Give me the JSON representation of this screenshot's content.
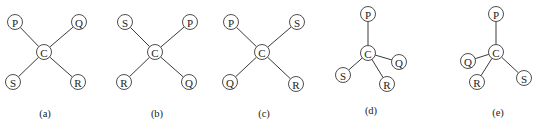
{
  "figure": {
    "node_radius": 7.5,
    "colors": {
      "line": "#3a3a3a",
      "text": "#222222",
      "fill": "#ffffff"
    },
    "panels": [
      {
        "id": "a",
        "caption": "(a)",
        "caption_pos": [
          45,
          117
        ],
        "center": {
          "label": "C",
          "x": 44,
          "y": 52
        },
        "nodes": [
          {
            "label": "P",
            "x": 15,
            "y": 22
          },
          {
            "label": "Q",
            "x": 79,
            "y": 22
          },
          {
            "label": "S",
            "x": 13,
            "y": 82
          },
          {
            "label": "R",
            "x": 78,
            "y": 82
          }
        ]
      },
      {
        "id": "b",
        "caption": "(b)",
        "caption_pos": [
          157,
          117
        ],
        "center": {
          "label": "C",
          "x": 155,
          "y": 52
        },
        "nodes": [
          {
            "label": "S",
            "x": 125,
            "y": 22
          },
          {
            "label": "P",
            "x": 190,
            "y": 22
          },
          {
            "label": "R",
            "x": 124,
            "y": 82
          },
          {
            "label": "Q",
            "x": 189,
            "y": 82
          }
        ]
      },
      {
        "id": "c",
        "caption": "(c)",
        "caption_pos": [
          264,
          117
        ],
        "center": {
          "label": "C",
          "x": 262,
          "y": 52
        },
        "nodes": [
          {
            "label": "P",
            "x": 231,
            "y": 22
          },
          {
            "label": "S",
            "x": 297,
            "y": 22
          },
          {
            "label": "Q",
            "x": 230,
            "y": 82
          },
          {
            "label": "R",
            "x": 296,
            "y": 84
          }
        ]
      },
      {
        "id": "d",
        "caption": "(d)",
        "caption_pos": [
          371,
          114
        ],
        "center": {
          "label": "C",
          "x": 368,
          "y": 53
        },
        "nodes": [
          {
            "label": "P",
            "x": 368,
            "y": 14
          },
          {
            "label": "Q",
            "x": 399,
            "y": 62
          },
          {
            "label": "S",
            "x": 343,
            "y": 75
          },
          {
            "label": "R",
            "x": 387,
            "y": 84
          }
        ]
      },
      {
        "id": "e",
        "caption": "(e)",
        "caption_pos": [
          498,
          116
        ],
        "center": {
          "label": "C",
          "x": 496,
          "y": 52
        },
        "nodes": [
          {
            "label": "P",
            "x": 496,
            "y": 14
          },
          {
            "label": "Q",
            "x": 468,
            "y": 61
          },
          {
            "label": "R",
            "x": 477,
            "y": 82
          },
          {
            "label": "S",
            "x": 524,
            "y": 78
          }
        ]
      }
    ]
  }
}
